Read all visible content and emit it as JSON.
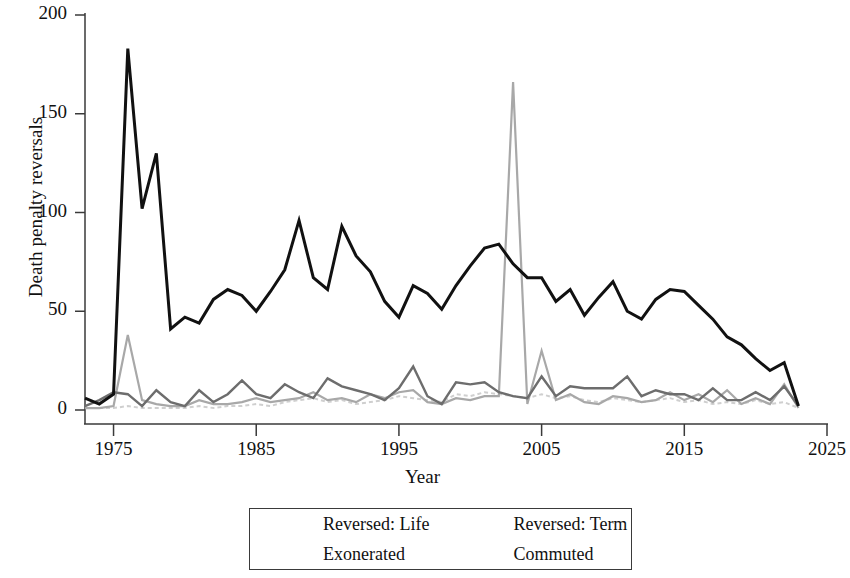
{
  "chart_data": {
    "type": "line",
    "title": "",
    "xlabel": "Year",
    "ylabel": "Death penalty reversals",
    "xlim": [
      1973,
      2025
    ],
    "ylim": [
      0,
      200
    ],
    "xticks": [
      1975,
      1985,
      1995,
      2005,
      2015,
      2025
    ],
    "xtick_labels": [
      "1975",
      "1985",
      "1995",
      "2005",
      "2015",
      "2025"
    ],
    "yticks": [
      0,
      50,
      100,
      150,
      200
    ],
    "ytick_labels": [
      "0",
      "50",
      "100",
      "150",
      "200"
    ],
    "grid": false,
    "legend_position": "below-center",
    "x": [
      1973,
      1974,
      1975,
      1976,
      1977,
      1978,
      1979,
      1980,
      1981,
      1982,
      1983,
      1984,
      1985,
      1986,
      1987,
      1988,
      1989,
      1990,
      1991,
      1992,
      1993,
      1994,
      1995,
      1996,
      1997,
      1998,
      1999,
      2000,
      2001,
      2002,
      2003,
      2004,
      2005,
      2006,
      2007,
      2008,
      2009,
      2010,
      2011,
      2012,
      2013,
      2014,
      2015,
      2016,
      2017,
      2018,
      2019,
      2020,
      2021,
      2022,
      2023
    ],
    "series": [
      {
        "name": "Reversed: Life",
        "color": "#111111",
        "width": 3.0,
        "dash": "none",
        "values": [
          6,
          3,
          8,
          183,
          102,
          130,
          41,
          47,
          44,
          56,
          61,
          58,
          50,
          60,
          71,
          96,
          67,
          61,
          93,
          78,
          70,
          55,
          47,
          63,
          59,
          51,
          63,
          73,
          82,
          84,
          74,
          67,
          67,
          55,
          61,
          48,
          57,
          65,
          50,
          46,
          56,
          61,
          60,
          53,
          46,
          37,
          33,
          26,
          20,
          24,
          2
        ]
      },
      {
        "name": "Reversed: Term",
        "color": "#6d6d6d",
        "width": 2.4,
        "dash": "none",
        "values": [
          2,
          5,
          9,
          8,
          2,
          10,
          4,
          2,
          10,
          4,
          8,
          15,
          8,
          6,
          13,
          9,
          6,
          16,
          12,
          10,
          8,
          5,
          11,
          22,
          7,
          3,
          14,
          13,
          14,
          9,
          7,
          6,
          17,
          7,
          12,
          11,
          11,
          11,
          17,
          7,
          10,
          8,
          8,
          5,
          11,
          5,
          5,
          9,
          5,
          12,
          2
        ]
      },
      {
        "name": "Exonerated",
        "color": "#a8a8a8",
        "width": 2.2,
        "dash": "none",
        "values": [
          1,
          1,
          2,
          38,
          5,
          3,
          2,
          2,
          5,
          3,
          3,
          4,
          6,
          4,
          5,
          6,
          9,
          5,
          6,
          4,
          8,
          6,
          9,
          10,
          4,
          3,
          6,
          5,
          7,
          7,
          166,
          3,
          30,
          5,
          8,
          4,
          3,
          7,
          6,
          4,
          5,
          9,
          5,
          8,
          4,
          10,
          3,
          6,
          3,
          13,
          1
        ]
      },
      {
        "name": "Commuted",
        "color": "#cfcfcf",
        "width": 2.0,
        "dash": "4,3",
        "values": [
          1,
          1,
          1,
          2,
          1,
          1,
          1,
          1,
          2,
          1,
          2,
          2,
          3,
          2,
          4,
          5,
          6,
          4,
          5,
          3,
          4,
          5,
          7,
          6,
          5,
          4,
          8,
          7,
          9,
          8,
          7,
          6,
          8,
          6,
          7,
          5,
          4,
          6,
          5,
          4,
          5,
          6,
          4,
          5,
          3,
          4,
          3,
          5,
          3,
          4,
          1
        ]
      }
    ]
  },
  "axes": {
    "x_label": "Year",
    "y_label": "Death penalty reversals"
  },
  "legend": {
    "entries": [
      {
        "label": "Reversed: Life"
      },
      {
        "label": "Reversed: Term"
      },
      {
        "label": "Exonerated"
      },
      {
        "label": "Commuted"
      }
    ]
  }
}
